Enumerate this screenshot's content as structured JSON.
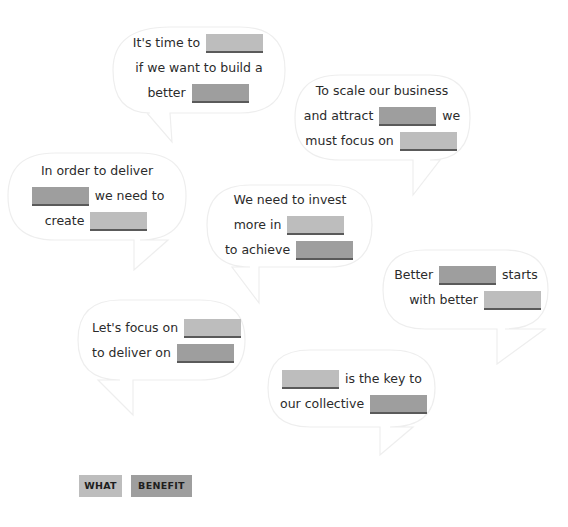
{
  "colors": {
    "what": "#bdbdbd",
    "benefit": "#9e9e9e",
    "underline": "#5a5a5a",
    "text": "#2b2b2b",
    "bubble_stroke": "#eeeeee"
  },
  "bubbles": [
    {
      "lines": [
        [
          "It's time to",
          "WHAT"
        ],
        [
          "if we want to build a"
        ],
        [
          "better",
          "BENEFIT"
        ]
      ]
    },
    {
      "lines": [
        [
          "To scale our business"
        ],
        [
          "and attract",
          "BENEFIT",
          "we"
        ],
        [
          "must focus on",
          "WHAT"
        ]
      ]
    },
    {
      "lines": [
        [
          "In order to deliver"
        ],
        [
          "BENEFIT",
          "we need to"
        ],
        [
          "create",
          "WHAT"
        ]
      ]
    },
    {
      "lines": [
        [
          "We need to invest"
        ],
        [
          "more in",
          "WHAT"
        ],
        [
          "to achieve",
          "BENEFIT"
        ]
      ]
    },
    {
      "lines": [
        [
          "Better",
          "BENEFIT",
          "starts"
        ],
        [
          "with better",
          "WHAT"
        ]
      ]
    },
    {
      "lines": [
        [
          "Let's focus on",
          "WHAT"
        ],
        [
          "to deliver on",
          "BENEFIT"
        ]
      ]
    },
    {
      "lines": [
        [
          "WHAT",
          "is the key to"
        ],
        [
          "our collective",
          "BENEFIT"
        ]
      ]
    }
  ],
  "text": {
    "b0": {
      "l0": "It's time to",
      "l1": "if we want to build a",
      "l2": "better"
    },
    "b1": {
      "l0": "To scale our business",
      "l1a": "and attract",
      "l1b": "we",
      "l2": "must focus on"
    },
    "b2": {
      "l0": "In order to deliver",
      "l1": "we need to",
      "l2": "create"
    },
    "b3": {
      "l0": "We need to invest",
      "l1": "more in",
      "l2": "to achieve"
    },
    "b4": {
      "l0a": "Better",
      "l0b": "starts",
      "l1": "with better"
    },
    "b5": {
      "l0": "Let's focus on",
      "l1": "to deliver on"
    },
    "b6": {
      "l0": "is the key to",
      "l1": "our collective"
    }
  },
  "legend": {
    "what": "WHAT",
    "benefit": "BENEFIT"
  }
}
